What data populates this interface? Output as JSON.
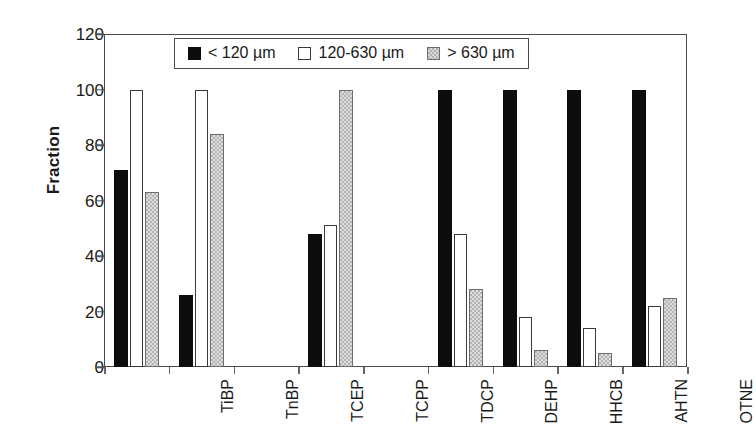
{
  "chart_data": {
    "type": "bar",
    "title": "",
    "xlabel": "",
    "ylabel": "Fraction",
    "ylim": [
      0,
      120
    ],
    "ytick_values": [
      0,
      20,
      40,
      60,
      80,
      100,
      120
    ],
    "ytick_labels": [
      "0",
      "20",
      "40",
      "60",
      "80",
      "100",
      "120"
    ],
    "grid": false,
    "legend_position": "inside-top-center",
    "categories": [
      "TiBP",
      "TnBP",
      "TCEP",
      "TCPP",
      "TDCP",
      "DEHP",
      "HHCB",
      "AHTN",
      "OTNE"
    ],
    "series": [
      {
        "name": "< 120 µm",
        "color": "#0d0d0d",
        "fill": "solid-black",
        "values": [
          71,
          26,
          0,
          48,
          0,
          100,
          100,
          100,
          100
        ]
      },
      {
        "name": "120-630 µm",
        "color": "#ffffff",
        "fill": "white-outline",
        "values": [
          100,
          100,
          0,
          51,
          0,
          48,
          18,
          14,
          22
        ]
      },
      {
        "name": "> 630 µm",
        "color": "#b4b4b4",
        "fill": "gray-hatch",
        "values": [
          63,
          84,
          0,
          100,
          0,
          28,
          6,
          5,
          25
        ]
      }
    ]
  },
  "colors": {
    "series_1": "#0d0d0d",
    "series_2": "#ffffff",
    "series_3": "#b4b4b4",
    "axis": "#4a4a4a",
    "text": "#1a1a1a",
    "background": "#ffffff"
  }
}
